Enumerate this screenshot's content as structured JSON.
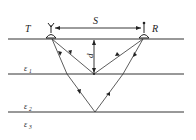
{
  "diagram": {
    "type": "GPR two-antenna layered reflection schematic",
    "labels": {
      "transmitter": "T",
      "receiver": "R",
      "separation": "S",
      "depth": "d",
      "layer1": "ε",
      "layer1_sub": "1",
      "layer2": "ε",
      "layer2_sub": "2",
      "layer3": "ε",
      "layer3_sub": "3"
    },
    "colors": {
      "line": "#333333",
      "text": "#222222"
    }
  }
}
